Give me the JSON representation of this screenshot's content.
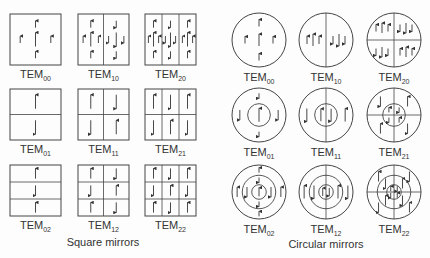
{
  "figure": {
    "square_caption": "Square mirrors",
    "circular_caption": "Circular mirrors",
    "footer_caption_cut": "",
    "line_color": "#444444",
    "square_modes": [
      {
        "prefix": "TEM",
        "sub": "00",
        "cols": 1,
        "rows": 1,
        "x": 10,
        "y": 14
      },
      {
        "prefix": "TEM",
        "sub": "10",
        "cols": 2,
        "rows": 1,
        "x": 78,
        "y": 14
      },
      {
        "prefix": "TEM",
        "sub": "20",
        "cols": 3,
        "rows": 1,
        "x": 145,
        "y": 14
      },
      {
        "prefix": "TEM",
        "sub": "01",
        "cols": 1,
        "rows": 2,
        "x": 10,
        "y": 89
      },
      {
        "prefix": "TEM",
        "sub": "11",
        "cols": 2,
        "rows": 2,
        "x": 78,
        "y": 89
      },
      {
        "prefix": "TEM",
        "sub": "21",
        "cols": 3,
        "rows": 2,
        "x": 145,
        "y": 89
      },
      {
        "prefix": "TEM",
        "sub": "02",
        "cols": 1,
        "rows": 3,
        "x": 10,
        "y": 165
      },
      {
        "prefix": "TEM",
        "sub": "12",
        "cols": 2,
        "rows": 3,
        "x": 78,
        "y": 165
      },
      {
        "prefix": "TEM",
        "sub": "22",
        "cols": 3,
        "rows": 3,
        "x": 145,
        "y": 165
      }
    ],
    "circular_modes": [
      {
        "prefix": "TEM",
        "sub": "00",
        "cx": 259,
        "cy": 40
      },
      {
        "prefix": "TEM",
        "sub": "10",
        "cx": 326,
        "cy": 40
      },
      {
        "prefix": "TEM",
        "sub": "20",
        "cx": 394,
        "cy": 40
      },
      {
        "prefix": "TEM",
        "sub": "01",
        "cx": 259,
        "cy": 115
      },
      {
        "prefix": "TEM",
        "sub": "11",
        "cx": 326,
        "cy": 115
      },
      {
        "prefix": "TEM",
        "sub": "21",
        "cx": 394,
        "cy": 115
      },
      {
        "prefix": "TEM",
        "sub": "02",
        "cx": 259,
        "cy": 192
      },
      {
        "prefix": "TEM",
        "sub": "12",
        "cx": 326,
        "cy": 192
      },
      {
        "prefix": "TEM",
        "sub": "22",
        "cx": 394,
        "cy": 192
      }
    ]
  }
}
